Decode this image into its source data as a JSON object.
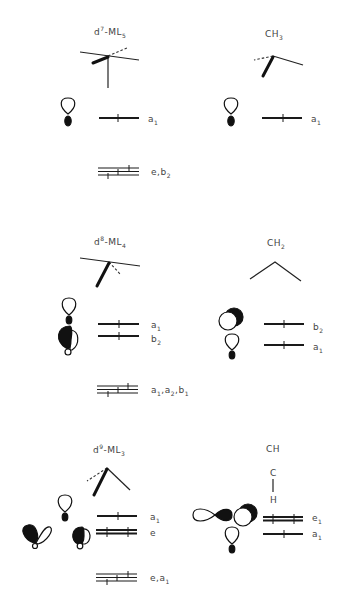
{
  "figure": {
    "panels": [
      {
        "id": "d7-ML5",
        "title": {
          "main": "d",
          "sup": "7",
          "rest": "-ML",
          "sub": "5"
        },
        "levels": [
          {
            "label": "a",
            "sub": "1",
            "type": "single",
            "electrons": 1
          },
          {
            "label": "e,b",
            "sub": "2",
            "type": "triple-stack",
            "electrons": 6
          }
        ]
      },
      {
        "id": "CH3",
        "title": {
          "main": "CH",
          "sub": "3"
        },
        "levels": [
          {
            "label": "a",
            "sub": "1",
            "type": "single",
            "electrons": 1
          }
        ]
      },
      {
        "id": "d8-ML4",
        "title": {
          "main": "d",
          "sup": "8",
          "rest": "-ML",
          "sub": "4"
        },
        "levels": [
          {
            "label": "a",
            "sub": "1",
            "type": "single",
            "electrons": 1
          },
          {
            "label": "b",
            "sub": "2",
            "type": "single",
            "electrons": 1
          },
          {
            "label": "a1,a2,b1",
            "parts": [
              [
                "a",
                "1"
              ],
              [
                "a",
                "2"
              ],
              [
                "b",
                "1"
              ]
            ],
            "type": "triple-stack",
            "electrons": 6
          }
        ]
      },
      {
        "id": "CH2",
        "title": {
          "main": "CH",
          "sub": "2"
        },
        "levels": [
          {
            "label": "b",
            "sub": "2",
            "type": "single",
            "electrons": 1
          },
          {
            "label": "a",
            "sub": "1",
            "type": "single",
            "electrons": 1
          }
        ]
      },
      {
        "id": "d9-ML3",
        "title": {
          "main": "d",
          "sup": "9",
          "rest": "-ML",
          "sub": "3"
        },
        "levels": [
          {
            "label": "a",
            "sub": "1",
            "type": "single",
            "electrons": 1
          },
          {
            "label": "e",
            "sub": "",
            "type": "double",
            "electrons": 2
          },
          {
            "label": "e,a",
            "sub": "1",
            "type": "triple-stack",
            "electrons": 6
          }
        ]
      },
      {
        "id": "CH",
        "title": {
          "main": "CH"
        },
        "structure_atoms": [
          "C",
          "H"
        ],
        "levels": [
          {
            "label": "e",
            "sub": "1",
            "type": "double",
            "electrons": 2
          },
          {
            "label": "a",
            "sub": "1",
            "type": "single",
            "electrons": 1
          }
        ]
      }
    ]
  }
}
